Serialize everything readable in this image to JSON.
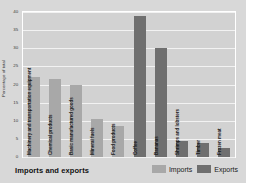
{
  "footer": {
    "title": "Imports and exports"
  },
  "legend": {
    "items": [
      {
        "label": "Imports",
        "color": "#a8a8a8"
      },
      {
        "label": "Exports",
        "color": "#6f6f6f"
      }
    ]
  },
  "chart_data": {
    "type": "bar",
    "title": "Imports and exports",
    "xlabel": "",
    "ylabel": "Percentage of total",
    "ylim": [
      0,
      40
    ],
    "yticks": [
      0,
      5,
      10,
      15,
      20,
      25,
      30,
      35,
      40
    ],
    "ytick_labels": [
      "0",
      "5",
      "10",
      "15",
      "20",
      "25",
      "30",
      "35",
      "40"
    ],
    "grid": true,
    "legend_position": "bottom-right",
    "categories": [
      "Machinery and transportation equipment",
      "Chemical products",
      "Basic manufactured goods",
      "Mineral fuels",
      "Food products",
      "Coffee",
      "Bananas",
      "Shrimps and lobsters",
      "Timber",
      "Frozen meat"
    ],
    "series": [
      {
        "name": "Imports",
        "color": "#a8a8a8",
        "values": [
          22,
          21.5,
          20,
          10.5,
          8.5,
          null,
          null,
          null,
          null,
          null
        ]
      },
      {
        "name": "Exports",
        "color": "#6f6f6f",
        "values": [
          null,
          null,
          null,
          null,
          null,
          39,
          30,
          4.5,
          3.8,
          2.5
        ]
      }
    ],
    "bars": [
      {
        "category": "Machinery and transportation equipment",
        "series": "Imports",
        "value": 22
      },
      {
        "category": "Chemical products",
        "series": "Imports",
        "value": 21.5
      },
      {
        "category": "Basic manufactured goods",
        "series": "Imports",
        "value": 20
      },
      {
        "category": "Mineral fuels",
        "series": "Imports",
        "value": 10.5
      },
      {
        "category": "Food products",
        "series": "Imports",
        "value": 8.5
      },
      {
        "category": "Coffee",
        "series": "Exports",
        "value": 39
      },
      {
        "category": "Bananas",
        "series": "Exports",
        "value": 30
      },
      {
        "category": "Shrimps and lobsters",
        "series": "Exports",
        "value": 4.5
      },
      {
        "category": "Timber",
        "series": "Exports",
        "value": 3.8
      },
      {
        "category": "Frozen meat",
        "series": "Exports",
        "value": 2.5
      }
    ]
  }
}
